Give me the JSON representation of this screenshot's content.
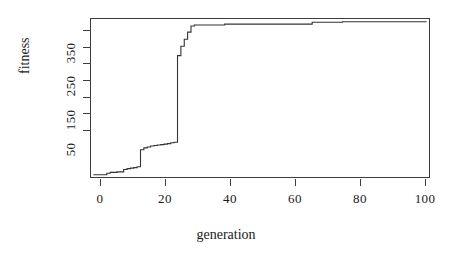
{
  "chart_data": {
    "type": "line",
    "title": "",
    "xlabel": "generation",
    "ylabel": "fitness",
    "xlim": [
      0,
      101
    ],
    "ylim": [
      20,
      360
    ],
    "grid": false,
    "legend": null,
    "line_color": "#333333",
    "background": "#ffffff",
    "axis_color": "#3d3d3d",
    "xticks": [
      0,
      20,
      40,
      60,
      80,
      100
    ],
    "xtick_labels": [
      "0",
      "20",
      "40",
      "60",
      "80",
      "100"
    ],
    "yticks": [
      50,
      150,
      250,
      350
    ],
    "ytick_labels": [
      "50",
      "150",
      "250",
      "350"
    ],
    "yticks_minor": [
      100,
      200,
      300
    ],
    "series": [
      {
        "name": "best fitness",
        "x": [
          1,
          3,
          5,
          6,
          8,
          9,
          10,
          11,
          12,
          13,
          14,
          15,
          16,
          17,
          18,
          19,
          20,
          21,
          22,
          23,
          24,
          25,
          26,
          27,
          28,
          29,
          30,
          31,
          34,
          39,
          40,
          50,
          60,
          65,
          66,
          70,
          74,
          75,
          85,
          95,
          100
        ],
        "y": [
          27,
          27,
          30,
          32,
          33,
          33,
          38,
          40,
          41,
          42,
          44,
          80,
          84,
          86,
          88,
          89,
          90,
          91,
          92,
          93,
          95,
          96,
          280,
          300,
          315,
          330,
          343,
          345,
          345,
          345,
          347,
          347,
          347,
          347,
          351,
          351,
          351,
          352,
          352,
          352,
          352
        ]
      }
    ]
  },
  "axes": {
    "xlabel": "generation",
    "ylabel": "fitness"
  }
}
